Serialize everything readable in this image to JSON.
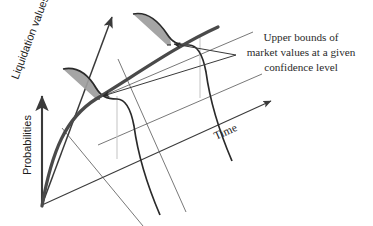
{
  "figure": {
    "kind": "3d-schematic-diagram",
    "background": "#ffffff",
    "width": 226,
    "axes": {
      "probabilities": {
        "label": "Probabilities",
        "orientation": "vertical",
        "arrow": "up",
        "color": "#3a3a3a"
      },
      "liquidation": {
        "label": "Liquidation values",
        "orientation": "diagonal-up-right",
        "arrow": "up-right",
        "color": "#3a3a3a"
      },
      "time": {
        "label": "Time",
        "orientation": "diagonal-up-right-shallow",
        "arrow": "up-right",
        "color": "#3a3a3a"
      }
    },
    "annotation": {
      "lines": [
        "Upper  bounds of",
        "market values at a given",
        "confidence level"
      ],
      "leader_count": 2,
      "color": "#2b2b2b"
    },
    "distributions": [
      {
        "name": "near-term-distribution",
        "tail_fill": "#9d9d9d",
        "curve_color": "#2a2a2a"
      },
      {
        "name": "far-term-distribution",
        "tail_fill": "#9d9d9d",
        "curve_color": "#2a2a2a"
      }
    ],
    "trend_curve": {
      "name": "expected-market-value-curve",
      "color": "#4a4a4a",
      "stroke_width": 3.2
    },
    "ghost_text": " "
  }
}
